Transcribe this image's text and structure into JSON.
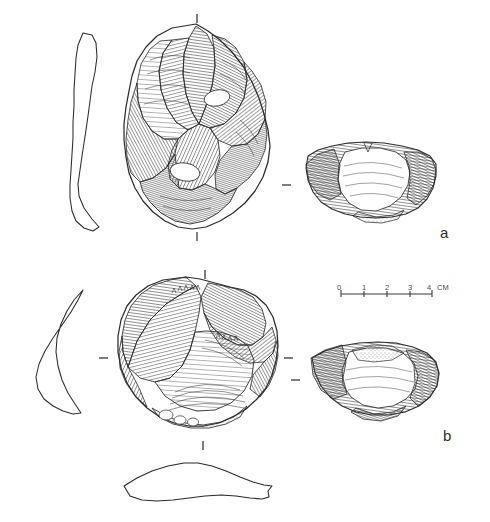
{
  "plate": {
    "title": "Lithic artefact plate",
    "background_color": "#ffffff",
    "ink_color": "#2b2b2b",
    "width": 490,
    "height": 522
  },
  "figures": [
    {
      "id": "a",
      "label": "a",
      "label_x": 445,
      "label_y": 236,
      "description": "Handaxe / flake tool, dorsal face with lateral profile and basal section",
      "views": [
        {
          "name": "lateral-profile",
          "position": "left",
          "outline_only": true
        },
        {
          "name": "dorsal-face",
          "position": "centre",
          "hatched": true
        },
        {
          "name": "cross-section",
          "position": "right",
          "hatched": true
        }
      ],
      "orientation_ticks": [
        {
          "name": "tick-top",
          "x": 197,
          "y": 18,
          "orientation": "vertical"
        },
        {
          "name": "tick-bottom",
          "x": 197,
          "y": 236,
          "orientation": "vertical"
        },
        {
          "name": "tick-right",
          "x": 287,
          "y": 185,
          "orientation": "horizontal"
        }
      ]
    },
    {
      "id": "b",
      "label": "b",
      "label_x": 448,
      "label_y": 439,
      "description": "Discoidal core, dorsal face with lateral profile and basal section",
      "views": [
        {
          "name": "lateral-profile",
          "position": "left",
          "outline_only": true
        },
        {
          "name": "dorsal-face",
          "position": "centre",
          "hatched": true
        },
        {
          "name": "cross-section",
          "position": "right",
          "hatched": true
        },
        {
          "name": "basal-profile",
          "position": "bottom",
          "outline_only": true
        }
      ],
      "orientation_ticks": [
        {
          "name": "tick-top",
          "x": 205,
          "y": 274,
          "orientation": "vertical"
        },
        {
          "name": "tick-bottom",
          "x": 203,
          "y": 445,
          "orientation": "vertical"
        },
        {
          "name": "tick-left",
          "x": 104,
          "y": 358,
          "orientation": "horizontal"
        },
        {
          "name": "tick-right",
          "x": 289,
          "y": 358,
          "orientation": "horizontal"
        },
        {
          "name": "tick-right-lower",
          "x": 295,
          "y": 380,
          "orientation": "horizontal"
        }
      ]
    }
  ],
  "scale_bar": {
    "name": "scale-bar",
    "unit": "CM",
    "ticks": [
      "0",
      "1",
      "2",
      "3",
      "4"
    ],
    "x_start": 341,
    "x_end": 432,
    "y_axis": 294,
    "total_cm": 4,
    "unit_label_x": 436,
    "unit_label_y": 290
  }
}
